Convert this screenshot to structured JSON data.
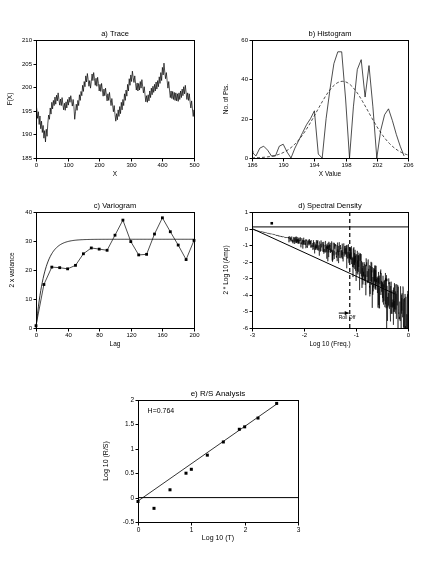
{
  "figure": {
    "background": "#ffffff",
    "ink": "#000000",
    "panel_count": 5
  },
  "chart_data": [
    {
      "id": "trace",
      "type": "line",
      "title": "a) Trace",
      "xlabel": "X",
      "ylabel": "F(X)",
      "xlim": [
        0,
        500
      ],
      "ylim": [
        185,
        210
      ],
      "xticks": [
        0,
        100,
        200,
        300,
        400,
        500
      ],
      "yticks": [
        185,
        190,
        195,
        200,
        205,
        210
      ],
      "grid": false,
      "legend": "none",
      "series": [
        {
          "name": "F(X)",
          "color": "#000000",
          "x_start": 0,
          "x_step": 2.5,
          "values": [
            196.6,
            195.3,
            193.4,
            194.8,
            192.1,
            193.9,
            191.2,
            192.8,
            190.4,
            191.9,
            189.2,
            190.8,
            188.4,
            191.1,
            189.6,
            192.4,
            194.1,
            193.2,
            195.6,
            194.3,
            196.8,
            195.4,
            197.2,
            196.1,
            197.9,
            196.4,
            198.3,
            197.1,
            198.8,
            197.4,
            196.2,
            197.5,
            196.1,
            197.8,
            196.4,
            195.2,
            196.6,
            195.1,
            196.9,
            195.6,
            197.4,
            196.2,
            197.9,
            196.8,
            198.2,
            197.1,
            196.0,
            197.4,
            195.9,
            193.2,
            194.8,
            196.4,
            195.1,
            197.2,
            196.1,
            198.4,
            197.2,
            199.1,
            198.2,
            200.4,
            199.1,
            201.2,
            200.1,
            202.4,
            201.1,
            202.9,
            201.6,
            200.2,
            201.4,
            199.8,
            201.2,
            202.8,
            201.4,
            203.1,
            201.8,
            200.4,
            201.9,
            200.2,
            202.1,
            200.8,
            199.2,
            200.6,
            199.1,
            200.8,
            199.4,
            198.1,
            199.6,
            198.2,
            199.8,
            198.4,
            197.1,
            198.6,
            197.2,
            198.9,
            197.4,
            196.1,
            197.6,
            196.2,
            194.8,
            196.1,
            194.2,
            192.8,
            194.4,
            193.1,
            195.2,
            193.8,
            195.9,
            194.4,
            196.8,
            195.2,
            197.4,
            196.1,
            198.6,
            197.2,
            199.4,
            198.1,
            200.6,
            199.2,
            201.8,
            200.4,
            202.6,
            201.2,
            203.4,
            202.1,
            201.0,
            202.4,
            200.8,
            199.4,
            200.9,
            199.2,
            200.8,
            199.4,
            201.2,
            199.8,
            201.6,
            200.2,
            198.8,
            200.1,
            198.4,
            196.9,
            198.2,
            196.8,
            198.4,
            197.1,
            199.2,
            197.8,
            199.8,
            198.4,
            200.2,
            198.9,
            200.6,
            199.2,
            201.1,
            199.6,
            201.4,
            200.1,
            202.2,
            200.8,
            203.1,
            201.4,
            204.2,
            202.6,
            205.1,
            203.2,
            201.8,
            203.1,
            201.4,
            199.8,
            201.2,
            199.4,
            197.8,
            199.2,
            197.6,
            199.1,
            197.4,
            198.9,
            197.2,
            198.8,
            197.1,
            198.6,
            197.0,
            198.8,
            197.4,
            199.2,
            197.8,
            199.6,
            198.2,
            200.1,
            198.6,
            200.4,
            198.9,
            197.4,
            198.8,
            197.2,
            198.6,
            197.0,
            195.6,
            197.1,
            195.4,
            193.8,
            195.2,
            193.6,
            195.1,
            193.4,
            195.0,
            193.8,
            195.4,
            194.1,
            196.2,
            194.8,
            196.9,
            195.4,
            197.4,
            196.1,
            198.2,
            196.8,
            198.8,
            197.4,
            199.4,
            198.1,
            200.2,
            198.8,
            200.9,
            199.4,
            201.6,
            200.1,
            202.4,
            200.8,
            203.2,
            201.4,
            202.1,
            200.6,
            201.9,
            200.2,
            198.8,
            200.1,
            198.4,
            196.9,
            198.2,
            196.6,
            198.0,
            196.4,
            197.8,
            196.2,
            197.6,
            196.0,
            197.4,
            195.8,
            197.2,
            195.6,
            197.1,
            195.9,
            197.6,
            196.2,
            198.4,
            196.9,
            199.2,
            197.6,
            200.1,
            198.4,
            201.2,
            199.2,
            202.1,
            200.4,
            203.2,
            201.2,
            204.1,
            202.4,
            205.0,
            203.1,
            201.6,
            203.0,
            201.2,
            199.6,
            201.0,
            199.2,
            197.6,
            199.0,
            197.4,
            198.9,
            197.2,
            198.8,
            197.0,
            198.6,
            196.8,
            198.4,
            196.6,
            198.2,
            196.4,
            198.0,
            196.8,
            198.6,
            197.2,
            199.4,
            197.8,
            200.2,
            198.4,
            201.1,
            199.2,
            202.0,
            199.8,
            202.8,
            200.4,
            203.6,
            201.2,
            202.4,
            200.8,
            201.9,
            200.2,
            198.8,
            200.1,
            198.4,
            196.8,
            198.2,
            196.4,
            197.9,
            196.2,
            197.8,
            196.0,
            197.6,
            195.8,
            197.4,
            196.2,
            198.1,
            196.8,
            199.0,
            197.4,
            199.8,
            198.1,
            200.6,
            198.8,
            201.4,
            199.4,
            202.2,
            200.1,
            203.0,
            200.8,
            203.8,
            201.4,
            202.6,
            201.0,
            202.1,
            200.4,
            198.9,
            200.2,
            198.6,
            197.0,
            198.4,
            196.8,
            198.2,
            196.6,
            198.0,
            196.4,
            197.8,
            196.1,
            197.6,
            195.8,
            197.2,
            195.4,
            196.8,
            195.0,
            196.4,
            194.6,
            196.0,
            194.2,
            195.6,
            193.8,
            195.2,
            193.4,
            194.8,
            193.0,
            194.4,
            192.6,
            194.0,
            192.2,
            193.6,
            191.8,
            193.2,
            191.4,
            192.8,
            191.0,
            192.4,
            190.4,
            191.8,
            189.8,
            191.2,
            189.2,
            190.8,
            188.6,
            190.2,
            188.0,
            189.6,
            187.4,
            189.0,
            186.9,
            188.4,
            187.8,
            188.4,
            187.2,
            187.9
          ]
        }
      ]
    },
    {
      "id": "histogram",
      "type": "line",
      "title": "b) Histogram",
      "xlabel": "X Value",
      "ylabel": "No. of Pts.",
      "xlim": [
        186,
        206
      ],
      "ylim": [
        0,
        60
      ],
      "xticks": [
        186,
        190,
        194,
        198,
        202,
        206
      ],
      "yticks": [
        0,
        20,
        40,
        60
      ],
      "grid": false,
      "legend": "none",
      "series": [
        {
          "name": "Frequency polygon",
          "color": "#000000",
          "x": [
            186.0,
            186.5,
            187.0,
            187.5,
            188.0,
            188.5,
            189.0,
            189.5,
            190.0,
            190.5,
            191.0,
            191.5,
            192.0,
            192.5,
            193.0,
            193.5,
            194.0,
            194.5,
            195.0,
            195.5,
            196.0,
            196.5,
            197.0,
            197.5,
            198.0,
            198.5,
            199.0,
            199.5,
            200.0,
            200.5,
            201.0,
            201.5,
            202.0,
            202.5,
            203.0,
            203.5,
            204.0,
            204.5,
            205.0,
            205.5
          ],
          "values": [
            3,
            1,
            5,
            6,
            4,
            1,
            1,
            6,
            7,
            3,
            0,
            5,
            9,
            13,
            17,
            20,
            24,
            2,
            0,
            20,
            35,
            48,
            54,
            54,
            30,
            0,
            26,
            45,
            50,
            31,
            47,
            26,
            0,
            14,
            22,
            25,
            19,
            12,
            6,
            1
          ]
        },
        {
          "name": "Normal fit",
          "color": "#000000",
          "dash": [
            3,
            2
          ],
          "mean": 197.6,
          "sigma": 3.3,
          "peak": 39
        }
      ]
    },
    {
      "id": "variogram",
      "type": "scatter",
      "title": "c) Variogram",
      "xlabel": "Lag",
      "ylabel": "2 x variance",
      "xlim": [
        0,
        200
      ],
      "ylim": [
        0,
        40
      ],
      "xticks": [
        0,
        40,
        80,
        120,
        160,
        200
      ],
      "yticks": [
        0,
        10,
        20,
        30,
        40
      ],
      "grid": false,
      "legend": "none",
      "series": [
        {
          "name": "Observed",
          "color": "#000000",
          "marker": "square",
          "x": [
            0,
            10,
            20,
            30,
            40,
            50,
            60,
            70,
            80,
            90,
            100,
            110,
            120,
            130,
            140,
            150,
            160,
            170,
            180,
            190,
            200
          ],
          "values": [
            0.8,
            15.0,
            21.0,
            20.8,
            20.4,
            21.6,
            25.6,
            27.6,
            27.2,
            26.8,
            32.0,
            37.2,
            29.8,
            25.2,
            25.4,
            32.4,
            38.0,
            33.2,
            28.6,
            23.6,
            30.2
          ]
        },
        {
          "name": "Model fit",
          "color": "#000000",
          "model": "exponential",
          "sill": 30.6,
          "range": 11.0
        }
      ]
    },
    {
      "id": "spectral",
      "type": "line",
      "title": "d) Spectral Density",
      "xlabel": "Log 10 (Freq.)",
      "ylabel": "2 * Log 10 (Amp)",
      "xlim": [
        -3,
        0
      ],
      "ylim": [
        -6,
        1
      ],
      "xticks": [
        -3,
        -2,
        -1,
        0
      ],
      "yticks": [
        -6,
        -5,
        -4,
        -3,
        -2,
        -1,
        0,
        1
      ],
      "grid": false,
      "legend": "none",
      "annotation": {
        "label": "Roll Off",
        "x": -1.12,
        "y": -5.1,
        "marker_x": -1.12,
        "line_style": "dashed"
      },
      "series": [
        {
          "name": "Spectrum",
          "color": "#000000",
          "noise_seed": 7,
          "slope": -1.35,
          "intercept": -0.05,
          "break_x": -1.15,
          "slope_after": -2.6
        },
        {
          "name": "Regression line",
          "color": "#000000",
          "x": [
            -3.0,
            -0.25
          ],
          "values": [
            0.0,
            -3.95
          ]
        },
        {
          "name": "Zero reference",
          "color": "#000000",
          "y_const": 0.1
        }
      ]
    },
    {
      "id": "rs",
      "type": "scatter",
      "title": "e) R/S Analysis",
      "xlabel": "Log 10 (T)",
      "ylabel": "Log 10 (R/S)",
      "xlim": [
        0,
        3
      ],
      "ylim": [
        -0.5,
        2
      ],
      "xticks": [
        0,
        1,
        2,
        3
      ],
      "yticks": [
        -0.5,
        0,
        0.5,
        1,
        1.5,
        2
      ],
      "grid": false,
      "legend": "none",
      "annotation": {
        "label": "H=0.764",
        "x": 0.18,
        "y": 1.78
      },
      "series": [
        {
          "name": "R/S points",
          "color": "#000000",
          "marker": "square",
          "x": [
            0.0,
            0.3,
            0.6,
            0.9,
            1.0,
            1.3,
            1.6,
            1.9,
            2.0,
            2.25,
            2.6
          ],
          "values": [
            -0.08,
            -0.22,
            0.16,
            0.5,
            0.58,
            0.87,
            1.14,
            1.4,
            1.45,
            1.63,
            1.93
          ]
        },
        {
          "name": "H slope line",
          "color": "#000000",
          "slope": 0.764,
          "intercept": -0.07,
          "x": [
            0.0,
            2.62
          ]
        },
        {
          "name": "Zero reference",
          "color": "#000000",
          "y_const": 0.0
        }
      ]
    }
  ]
}
